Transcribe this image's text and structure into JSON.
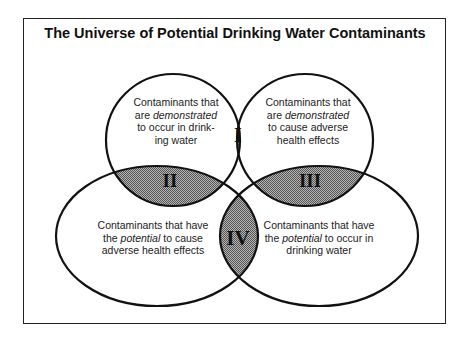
{
  "title": "The Universe of Potential Drinking Water Contaminants",
  "colors": {
    "stroke": "#111111",
    "overlap_fill": "#8a8a8a",
    "background": "#ffffff"
  },
  "sets": [
    {
      "id": "demonstrated-occur",
      "line1": "Contaminants that",
      "line2_pre": "are ",
      "line2_em": "demonstrated",
      "line2_post": "",
      "line3": "to occur in drink-",
      "line4": "ing water"
    },
    {
      "id": "demonstrated-health",
      "line1": "Contaminants that",
      "line2_pre": "are ",
      "line2_em": "demonstrated",
      "line2_post": "",
      "line3": "to cause adverse",
      "line4": "health effects"
    },
    {
      "id": "potential-health",
      "line1": "Contaminants that have",
      "line2_pre": "the ",
      "line2_em": "potential",
      "line2_post": " to cause",
      "line3": "adverse health effects"
    },
    {
      "id": "potential-occur",
      "line1": "Contaminants that have",
      "line2_pre": "the ",
      "line2_em": "potential",
      "line2_post": " to occur in",
      "line3": "drinking water"
    }
  ],
  "regions": {
    "I": "I",
    "II": "II",
    "III": "III",
    "IV": "IV"
  }
}
